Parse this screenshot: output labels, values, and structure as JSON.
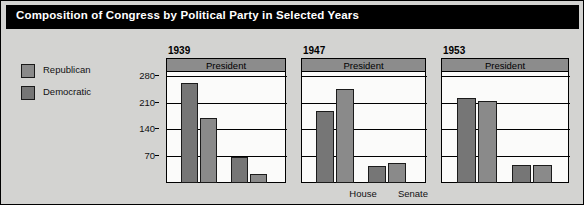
{
  "title": "Composition of Congress by Political Party in Selected Years",
  "colors": {
    "figure_background": "#d3d3d1",
    "title_background": "#000000",
    "title_text": "#ffffff",
    "plot_background": "#fbfbfa",
    "republican": "#8a8a8a",
    "democratic": "#767676",
    "president_band": "#8c8c8c",
    "axis": "#000000"
  },
  "legend": {
    "position": "left",
    "items": [
      {
        "label": "Republican",
        "color": "#8a8a8a"
      },
      {
        "label": "Democratic",
        "color": "#767676"
      }
    ]
  },
  "chart_data": {
    "type": "bar",
    "title": "Composition of Congress by Political Party in Selected Years",
    "xlabel": "",
    "ylabel": "",
    "ylim": [
      0,
      300
    ],
    "yticks": [
      70,
      140,
      210,
      280
    ],
    "grid": true,
    "legend_position": "left",
    "panel_header": "President",
    "categories": [
      "House",
      "Senate"
    ],
    "panels": [
      {
        "year": "1939",
        "president_label": "President",
        "groups": [
          {
            "category": "House",
            "bars": [
              {
                "party": "Democratic",
                "value": 262
              },
              {
                "party": "Republican",
                "value": 169
              }
            ]
          },
          {
            "category": "Senate",
            "bars": [
              {
                "party": "Democratic",
                "value": 69
              },
              {
                "party": "Republican",
                "value": 23
              }
            ]
          }
        ]
      },
      {
        "year": "1947",
        "president_label": "President",
        "groups": [
          {
            "category": "House",
            "bars": [
              {
                "party": "Democratic",
                "value": 188
              },
              {
                "party": "Republican",
                "value": 246
              }
            ]
          },
          {
            "category": "Senate",
            "bars": [
              {
                "party": "Democratic",
                "value": 45
              },
              {
                "party": "Republican",
                "value": 51
              }
            ]
          }
        ]
      },
      {
        "year": "1953",
        "president_label": "President",
        "groups": [
          {
            "category": "House",
            "bars": [
              {
                "party": "Democratic",
                "value": 221
              },
              {
                "party": "Republican",
                "value": 213
              }
            ]
          },
          {
            "category": "Senate",
            "bars": [
              {
                "party": "Democratic",
                "value": 48
              },
              {
                "party": "Republican",
                "value": 47
              }
            ]
          }
        ]
      }
    ]
  }
}
